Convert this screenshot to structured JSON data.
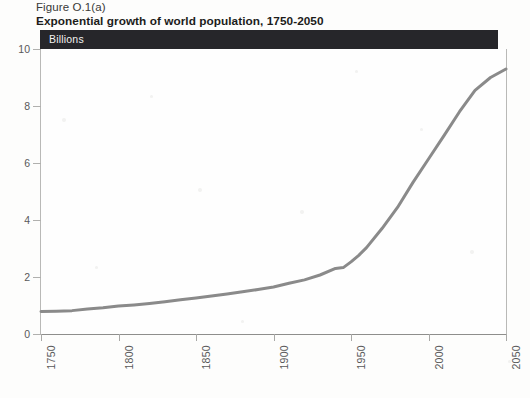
{
  "figure": {
    "number": "Figure O.1(a)",
    "title": "Exponential growth of world population, 1750-2050",
    "unit_bar_label": "Billions"
  },
  "chart_data": {
    "type": "line",
    "title": "Exponential growth of world population, 1750-2050",
    "subtitle": "Figure O.1(a)",
    "xlabel": "",
    "ylabel": "Billions",
    "xlim": [
      1750,
      2050
    ],
    "ylim": [
      0,
      10
    ],
    "grid": false,
    "legend": null,
    "line_color": "#8a8a8a",
    "x_ticks": [
      "1750",
      "1800",
      "1850",
      "1900",
      "1950",
      "2000",
      "2050"
    ],
    "y_ticks": [
      "0",
      "2",
      "4",
      "6",
      "8",
      "10"
    ],
    "series": [
      {
        "name": "World population",
        "x": [
          1750,
          1760,
          1770,
          1780,
          1790,
          1800,
          1810,
          1820,
          1830,
          1840,
          1850,
          1860,
          1870,
          1880,
          1890,
          1900,
          1910,
          1920,
          1930,
          1940,
          1945,
          1950,
          1955,
          1960,
          1970,
          1980,
          1990,
          2000,
          2010,
          2020,
          2030,
          2040,
          2050
        ],
        "values": [
          0.79,
          0.8,
          0.82,
          0.88,
          0.92,
          0.98,
          1.02,
          1.07,
          1.13,
          1.2,
          1.26,
          1.33,
          1.4,
          1.48,
          1.56,
          1.65,
          1.78,
          1.9,
          2.07,
          2.3,
          2.33,
          2.53,
          2.76,
          3.03,
          3.7,
          4.44,
          5.32,
          6.14,
          6.96,
          7.8,
          8.55,
          9.0,
          9.3
        ]
      }
    ]
  }
}
